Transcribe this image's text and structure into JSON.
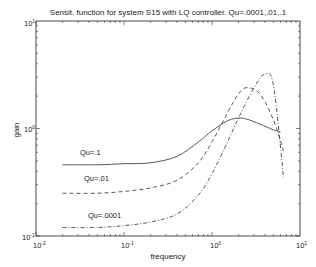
{
  "chart_data": {
    "type": "line",
    "title": "Sensit. function for system S15 with LQ controller. Qu=.0001,.01,.1",
    "xlabel": "frequency",
    "ylabel": "gain",
    "xscale": "log",
    "yscale": "log",
    "xlim": [
      0.01,
      10
    ],
    "ylim": [
      0.1,
      10
    ],
    "xticks": [
      "10^-2",
      "10^-1",
      "10^0",
      "10^1"
    ],
    "yticks": [
      "10^-1",
      "10^0",
      "10^1"
    ],
    "grid": false,
    "legend": "inline annotations",
    "series": [
      {
        "name": "Qu=.1",
        "style": "solid",
        "x": [
          0.02,
          0.05,
          0.1,
          0.2,
          0.4,
          0.7,
          1.0,
          1.5,
          2.0,
          2.5,
          3.5,
          5.0,
          6.0
        ],
        "y": [
          0.46,
          0.46,
          0.47,
          0.48,
          0.55,
          0.75,
          0.95,
          1.18,
          1.25,
          1.22,
          1.1,
          0.97,
          0.93
        ]
      },
      {
        "name": "Qu=.01",
        "style": "dashed",
        "x": [
          0.02,
          0.05,
          0.1,
          0.2,
          0.4,
          0.7,
          1.0,
          1.5,
          2.0,
          2.5,
          3.5,
          5.0,
          6.5
        ],
        "y": [
          0.25,
          0.25,
          0.26,
          0.28,
          0.33,
          0.48,
          0.75,
          1.4,
          2.1,
          2.4,
          2.1,
          1.2,
          0.62
        ]
      },
      {
        "name": "Qu=.0001",
        "style": "dash-dot",
        "x": [
          0.02,
          0.05,
          0.1,
          0.2,
          0.4,
          0.7,
          1.0,
          1.5,
          2.0,
          3.0,
          4.0,
          5.0,
          6.5
        ],
        "y": [
          0.12,
          0.12,
          0.125,
          0.135,
          0.16,
          0.24,
          0.38,
          0.75,
          1.25,
          2.4,
          3.2,
          2.5,
          0.35
        ]
      }
    ],
    "annotations": [
      {
        "text": "Qu=.1",
        "x": 0.028,
        "y": 0.6
      },
      {
        "text": "Qu=.01",
        "x": 0.03,
        "y": 0.32
      },
      {
        "text": "Qu=.0001",
        "x": 0.035,
        "y": 0.15
      }
    ]
  },
  "labels": {
    "title": "Sensit. function for system S15 with LQ controller. Qu=.0001,.01,.1",
    "xlabel": "frequency",
    "ylabel": "gain",
    "ann1": "Qu=.1",
    "ann2": "Qu=.01",
    "ann3": "Qu=.0001"
  }
}
